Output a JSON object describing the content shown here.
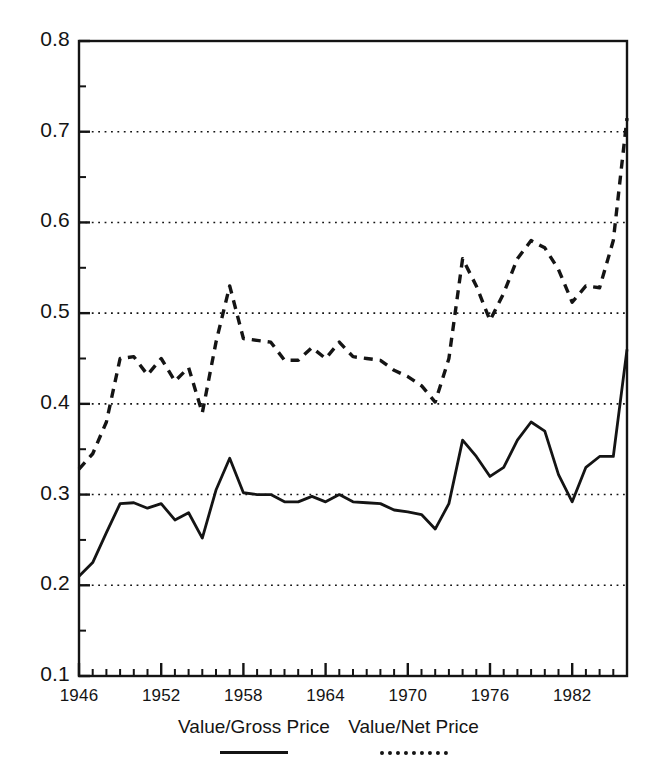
{
  "chart_data": {
    "type": "line",
    "title": "",
    "xlabel": "",
    "ylabel": "",
    "xlim": [
      1946,
      1986
    ],
    "ylim": [
      0.1,
      0.8
    ],
    "grid": true,
    "grid_axis": "y",
    "legend_position": "bottom",
    "y_ticks": [
      "0.8",
      "0.7",
      "0.6",
      "0.5",
      "0.4",
      "0.3",
      "0.2",
      "0.1"
    ],
    "y_tick_values": [
      0.8,
      0.7,
      0.6,
      0.5,
      0.4,
      0.3,
      0.2,
      0.1
    ],
    "y_minor_tick_values": [
      0.75,
      0.65,
      0.55,
      0.45,
      0.35,
      0.25,
      0.15
    ],
    "x_ticks": [
      "1946",
      "1952",
      "1958",
      "1964",
      "1970",
      "1976",
      "1982"
    ],
    "x_tick_values": [
      1946,
      1952,
      1958,
      1964,
      1970,
      1976,
      1982
    ],
    "x_minor_tick_step": 1,
    "x": [
      1946,
      1947,
      1948,
      1949,
      1950,
      1951,
      1952,
      1953,
      1954,
      1955,
      1956,
      1957,
      1958,
      1959,
      1960,
      1961,
      1962,
      1963,
      1964,
      1965,
      1966,
      1967,
      1968,
      1969,
      1970,
      1971,
      1972,
      1973,
      1974,
      1975,
      1976,
      1977,
      1978,
      1979,
      1980,
      1981,
      1982,
      1983,
      1984,
      1985,
      1986
    ],
    "series": [
      {
        "name": "Value/Gross Price",
        "style": "solid",
        "color": "#141414",
        "values": [
          0.21,
          0.225,
          0.258,
          0.29,
          0.291,
          0.285,
          0.29,
          0.272,
          0.28,
          0.252,
          0.305,
          0.34,
          0.302,
          0.3,
          0.3,
          0.292,
          0.292,
          0.298,
          0.292,
          0.3,
          0.292,
          0.291,
          0.29,
          0.283,
          0.281,
          0.278,
          0.262,
          0.29,
          0.36,
          0.342,
          0.32,
          0.33,
          0.36,
          0.38,
          0.37,
          0.322,
          0.292,
          0.33,
          0.342,
          0.342,
          0.46
        ]
      },
      {
        "name": "Value/Net Price",
        "style": "dashed",
        "color": "#141414",
        "values": [
          0.328,
          0.345,
          0.38,
          0.45,
          0.452,
          0.432,
          0.45,
          0.425,
          0.44,
          0.39,
          0.468,
          0.53,
          0.472,
          0.47,
          0.468,
          0.448,
          0.448,
          0.462,
          0.45,
          0.468,
          0.452,
          0.45,
          0.448,
          0.437,
          0.43,
          0.42,
          0.402,
          0.45,
          0.56,
          0.53,
          0.492,
          0.522,
          0.56,
          0.58,
          0.572,
          0.548,
          0.512,
          0.53,
          0.528,
          0.58,
          0.715
        ]
      }
    ]
  },
  "legend": {
    "entries": [
      {
        "label": "Value/Gross Price",
        "style": "solid"
      },
      {
        "label": "Value/Net Price",
        "style": "dashed"
      }
    ]
  }
}
